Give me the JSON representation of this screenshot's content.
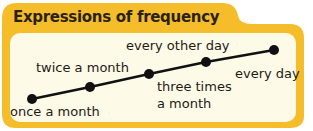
{
  "title": "Expressions of frequency",
  "colors": {
    "frame": "#f5bd2a",
    "panel": "#fdfbe8",
    "line": "#111111",
    "text": "#1f1a14"
  },
  "scale": {
    "points": [
      {
        "label": "once a month"
      },
      {
        "label": "twice a month"
      },
      {
        "label": "three times a month",
        "lines": [
          "three times",
          "a month"
        ]
      },
      {
        "label": "every other day"
      },
      {
        "label": "every day"
      }
    ]
  }
}
